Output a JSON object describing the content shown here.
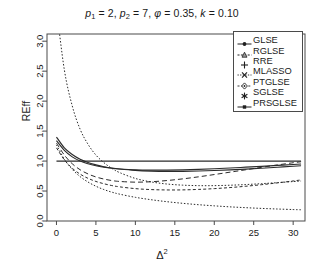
{
  "title": {
    "full": "p1 = 2, p2 = 7, phi = 0.35, k = 0.10",
    "p1_name": "p",
    "p1_sub": "1",
    "p1_val": "= 2,",
    "p2_name": "p",
    "p2_sub": "2",
    "p2_val": "= 7,",
    "phi_name": "φ",
    "phi_val": "= 0.35,",
    "k_name": "k",
    "k_val": "= 0.10"
  },
  "axes": {
    "xlabel_base": "Δ",
    "xlabel_exp": "2",
    "ylabel": "REff",
    "xticks": [
      "0",
      "5",
      "10",
      "15",
      "20",
      "25",
      "30"
    ],
    "yticks": [
      "0.0",
      "0.5",
      "1.0",
      "1.5",
      "2.0",
      "2.5",
      "3.0"
    ]
  },
  "legend": {
    "items": [
      {
        "label": "GLSE",
        "symbol": "filled-circle-line"
      },
      {
        "label": "RGLSE",
        "symbol": "triangle-line"
      },
      {
        "label": "RRE",
        "symbol": "plus"
      },
      {
        "label": "MLASSO",
        "symbol": "cross-x"
      },
      {
        "label": "PTGLSE",
        "symbol": "diamond-dot"
      },
      {
        "label": "SGLSE",
        "symbol": "asterisk"
      },
      {
        "label": "PRSGLSE",
        "symbol": "filled-square-line"
      }
    ]
  },
  "chart_data": {
    "type": "line",
    "title": "p1 = 2, p2 = 7, φ = 0.35, k = 0.10",
    "xlabel": "Δ²",
    "ylabel": "REff",
    "xlim": [
      -1.2,
      31.5
    ],
    "ylim": [
      0.0,
      3.12
    ],
    "grid": false,
    "legend_position": "top-right",
    "x": [
      0,
      1,
      2,
      3,
      4,
      5,
      6,
      7,
      8,
      10,
      12,
      14,
      16,
      18,
      20,
      22,
      24,
      26,
      28,
      30,
      31
    ],
    "series": [
      {
        "name": "GLSE",
        "style": "solid",
        "values": [
          1.0,
          1.0,
          1.0,
          1.0,
          1.0,
          1.0,
          1.0,
          1.0,
          1.0,
          1.0,
          1.0,
          1.0,
          1.0,
          1.0,
          1.0,
          1.0,
          1.0,
          1.0,
          1.0,
          1.0,
          1.0
        ]
      },
      {
        "name": "RGLSE",
        "style": "solid",
        "values": [
          1.4,
          1.22,
          1.11,
          1.03,
          0.975,
          0.937,
          0.906,
          0.884,
          0.868,
          0.845,
          0.833,
          0.828,
          0.829,
          0.834,
          0.842,
          0.852,
          0.865,
          0.88,
          0.896,
          0.913,
          0.922
        ]
      },
      {
        "name": "RRE",
        "style": "solid",
        "values": [
          1.34,
          1.18,
          1.07,
          1.0,
          0.955,
          0.922,
          0.898,
          0.88,
          0.868,
          0.853,
          0.848,
          0.849,
          0.854,
          0.862,
          0.872,
          0.884,
          0.898,
          0.912,
          0.927,
          0.943,
          0.951
        ]
      },
      {
        "name": "MLASSO",
        "style": "dashed",
        "values": [
          1.3,
          1.1,
          0.955,
          0.855,
          0.785,
          0.735,
          0.7,
          0.675,
          0.66,
          0.648,
          0.655,
          0.675,
          0.703,
          0.737,
          0.775,
          0.815,
          0.855,
          0.896,
          0.935,
          0.972,
          0.988
        ]
      },
      {
        "name": "PTGLSE",
        "style": "dotted",
        "values": [
          3.55,
          2.52,
          1.92,
          1.53,
          1.28,
          1.1,
          0.975,
          0.88,
          0.808,
          0.71,
          0.652,
          0.617,
          0.598,
          0.59,
          0.59,
          0.597,
          0.608,
          0.623,
          0.64,
          0.658,
          0.667
        ]
      },
      {
        "name": "SGLSE",
        "style": "dashed-fine",
        "values": [
          1.22,
          1.02,
          0.88,
          0.782,
          0.712,
          0.66,
          0.622,
          0.592,
          0.57,
          0.54,
          0.524,
          0.518,
          0.519,
          0.527,
          0.54,
          0.558,
          0.58,
          0.606,
          0.636,
          0.668,
          0.685
        ]
      },
      {
        "name": "PRSGLSE",
        "style": "dotted",
        "values": [
          1.27,
          1.03,
          0.862,
          0.74,
          0.65,
          0.58,
          0.525,
          0.482,
          0.448,
          0.395,
          0.355,
          0.322,
          0.295,
          0.272,
          0.253,
          0.236,
          0.222,
          0.21,
          0.2,
          0.191,
          0.187
        ]
      }
    ]
  }
}
